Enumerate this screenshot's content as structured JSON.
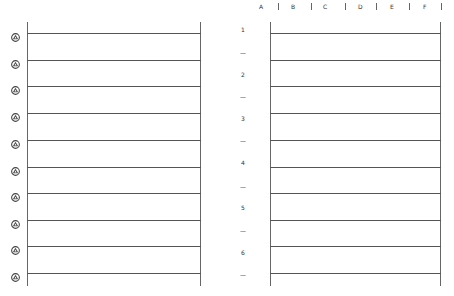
{
  "column_headers": [
    {
      "label": "A",
      "x": 259
    },
    {
      "label": "B",
      "x": 291
    },
    {
      "label": "C",
      "x": 323
    },
    {
      "label": "D",
      "x": 358
    },
    {
      "label": "E",
      "x": 390
    },
    {
      "label": "F",
      "x": 423
    }
  ],
  "column_separators": [
    278,
    311,
    345,
    376,
    409,
    441
  ],
  "left_panel": {
    "rows": [
      {
        "icon": "rotate-handle-icon",
        "y": 33
      },
      {
        "icon": "rotate-handle-icon",
        "y": 60
      },
      {
        "icon": "rotate-handle-icon",
        "y": 86
      },
      {
        "icon": "rotate-handle-icon",
        "y": 113
      },
      {
        "icon": "rotate-handle-icon",
        "y": 140
      },
      {
        "icon": "rotate-handle-icon",
        "y": 167
      },
      {
        "icon": "rotate-handle-icon",
        "y": 193
      },
      {
        "icon": "rotate-handle-icon",
        "y": 220
      },
      {
        "icon": "rotate-handle-icon",
        "y": 246
      },
      {
        "icon": "rotate-handle-icon",
        "y": 273
      }
    ]
  },
  "middle_labels": [
    {
      "text": "1",
      "y": 26
    },
    {
      "text": "—",
      "y": 49
    },
    {
      "text": "2",
      "y": 71
    },
    {
      "text": "—",
      "y": 93
    },
    {
      "text": "3",
      "y": 115
    },
    {
      "text": "—",
      "y": 137
    },
    {
      "text": "4",
      "y": 159
    },
    {
      "text": "—",
      "y": 183
    },
    {
      "text": "5",
      "y": 204
    },
    {
      "text": "—",
      "y": 227
    },
    {
      "text": "6",
      "y": 249
    },
    {
      "text": "—",
      "y": 271
    }
  ],
  "right_panel": {
    "line_y": [
      33,
      60,
      86,
      113,
      140,
      167,
      193,
      220,
      246,
      273
    ]
  },
  "colors": {
    "line": "#555555",
    "icon": "#444444",
    "background": "#ffffff"
  }
}
